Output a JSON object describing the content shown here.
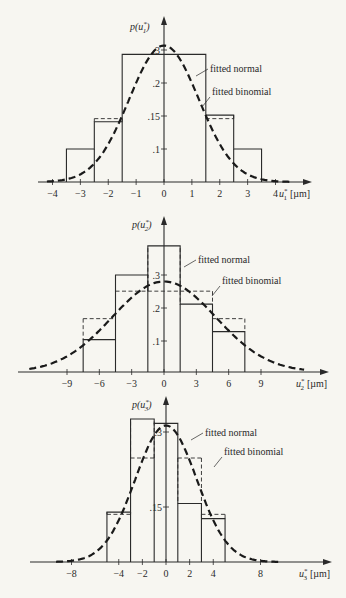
{
  "chart_data": [
    {
      "type": "bar",
      "panel": 1,
      "ylabel": "p(u1*)",
      "ylabel_parts": {
        "var": "u",
        "sub": "1",
        "sup": "*"
      },
      "xlabel": "u1* [µm]",
      "xlabel_unit": "[µm]",
      "x_ticks": [
        -4,
        -3,
        -2,
        -1,
        0,
        1,
        2,
        3,
        4
      ],
      "y_ticks": [
        ".1",
        ".15",
        ".2",
        ".3"
      ],
      "bin_edges": [
        -3.5,
        -2.5,
        -1.5,
        1.5,
        2.5,
        3.5
      ],
      "series": [
        {
          "name": "histogram",
          "style": "solid",
          "values": [
            0.075,
            0.137,
            0.29,
            0.152,
            0.075
          ]
        },
        {
          "name": "fitted binomial",
          "style": "dashed-steps",
          "values": [
            0.075,
            0.144,
            0.29,
            0.144,
            0.075
          ]
        },
        {
          "name": "fitted normal",
          "style": "dashed-curve",
          "peak": 0.31,
          "sigma": 1.25
        }
      ],
      "annotations": [
        "fitted normal",
        "fitted binomial"
      ],
      "xlim": [
        -4.2,
        4.6
      ]
    },
    {
      "type": "bar",
      "panel": 2,
      "ylabel": "p(u2*)",
      "ylabel_parts": {
        "var": "u",
        "sub": "2",
        "sup": "*"
      },
      "xlabel": "u2* [µm]",
      "xlabel_unit": "[µm]",
      "x_ticks": [
        -9,
        -6,
        -3,
        0,
        3,
        6,
        9
      ],
      "y_ticks": [
        ".1",
        ".2",
        ".3"
      ],
      "bin_edges": [
        -7.5,
        -4.5,
        -1.5,
        1.5,
        4.5,
        7.5
      ],
      "series": [
        {
          "name": "histogram",
          "style": "solid",
          "values": [
            0.1,
            0.3,
            0.39,
            0.21,
            0.125
          ]
        },
        {
          "name": "fitted binomial",
          "style": "dashed-steps",
          "values": [
            0.165,
            0.25,
            0.25,
            0.25,
            0.165
          ]
        },
        {
          "name": "fitted normal",
          "style": "dashed-curve",
          "peak": 0.28,
          "sigma": 4.8
        }
      ],
      "annotations": [
        "fitted normal",
        "fitted binomial"
      ],
      "xlim": [
        -12.5,
        13
      ]
    },
    {
      "type": "bar",
      "panel": 3,
      "ylabel": "p(u3*)",
      "ylabel_parts": {
        "var": "u",
        "sub": "3",
        "sup": "*"
      },
      "xlabel": "u3* [µm]",
      "xlabel_unit": "[µm]",
      "x_ticks": [
        -8,
        -4,
        -2,
        0,
        2,
        4,
        8
      ],
      "y_ticks": [
        ".15",
        ".3"
      ],
      "bin_edges": [
        -5,
        -3,
        -1,
        1,
        3,
        5
      ],
      "series": [
        {
          "name": "histogram",
          "style": "solid",
          "values": [
            0.115,
            0.33,
            0.32,
            0.135,
            0.1
          ]
        },
        {
          "name": "fitted binomial",
          "style": "dashed-steps",
          "values": [
            0.11,
            0.24,
            0.32,
            0.24,
            0.11
          ]
        },
        {
          "name": "fitted normal",
          "style": "dashed-curve",
          "peak": 0.315,
          "sigma": 2.6
        }
      ],
      "annotations": [
        "fitted normal",
        "fitted binomial"
      ],
      "xlim": [
        -9.3,
        9.5
      ]
    }
  ],
  "labels": {
    "fitted_normal": "fitted normal",
    "fitted_binomial": "fitted binomial",
    "p": "p(",
    "close": ")",
    "u": "u",
    "star": "*",
    "unit": "[µm]"
  }
}
